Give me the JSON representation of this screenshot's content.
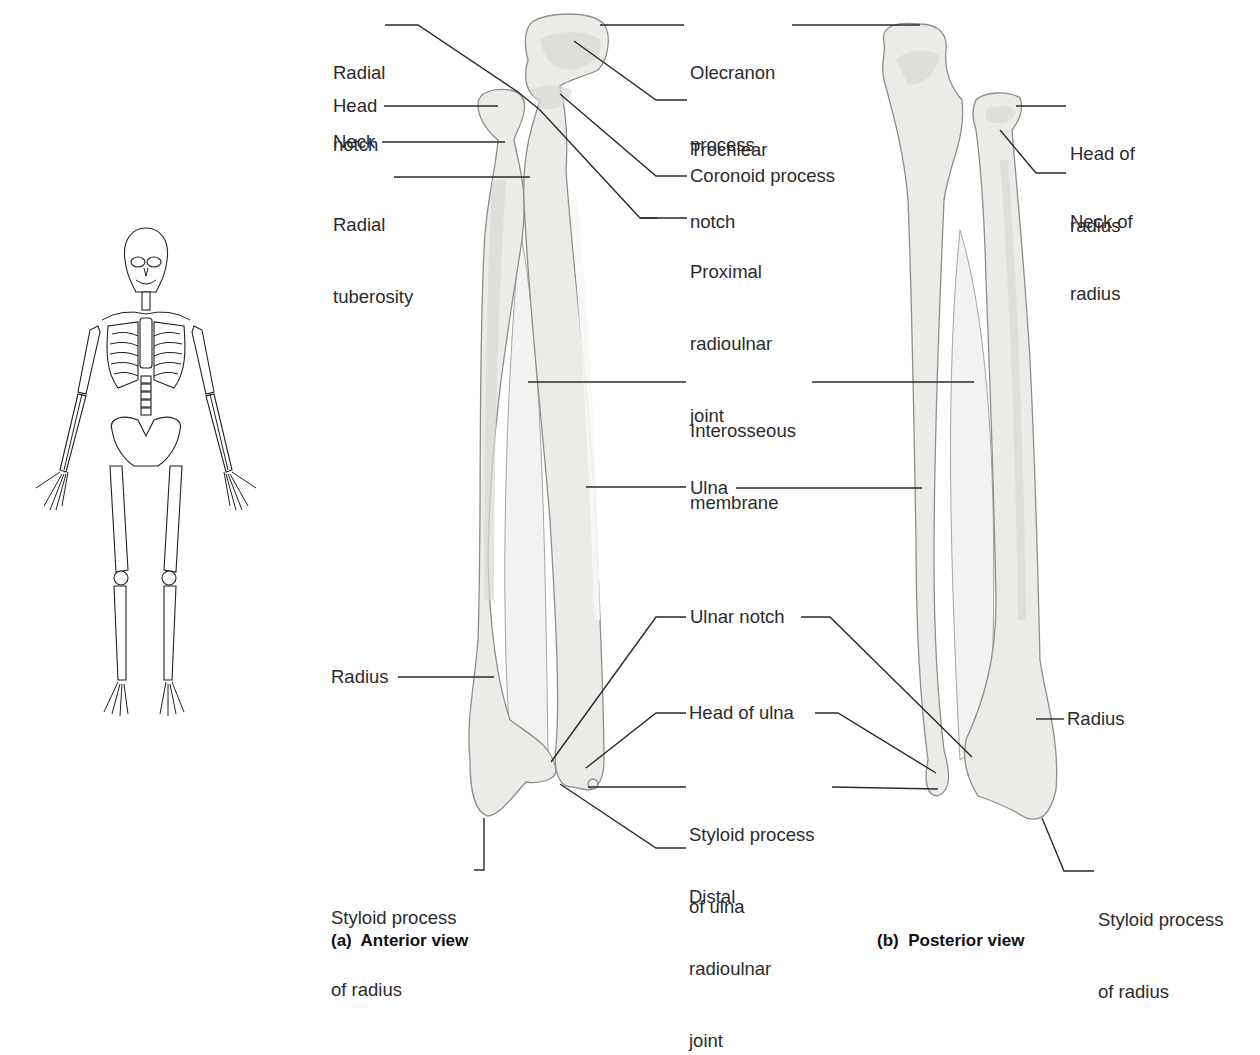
{
  "figure": {
    "panels": [
      {
        "id": "a",
        "caption": "(a)  Anterior view"
      },
      {
        "id": "b",
        "caption": "(b)  Posterior view"
      }
    ]
  },
  "anterior_labels": {
    "radial_notch": [
      "Radial",
      "notch"
    ],
    "head": [
      "Head"
    ],
    "neck": [
      "Neck"
    ],
    "radial_tuberosity": [
      "Radial",
      "tuberosity"
    ],
    "radius": [
      "Radius"
    ],
    "styloid_process_of_radius": [
      "Styloid process",
      "of radius"
    ]
  },
  "center_labels": {
    "olecranon_process": [
      "Olecranon",
      "process"
    ],
    "trochlear_notch": [
      "Trochlear",
      "notch"
    ],
    "coronoid_process": [
      "Coronoid process"
    ],
    "proximal_radioulnar_joint": [
      "Proximal",
      "radioulnar",
      "joint"
    ],
    "interosseous_membrane": [
      "Interosseous",
      "membrane"
    ],
    "ulna": [
      "Ulna"
    ],
    "ulnar_notch": [
      "Ulnar notch"
    ],
    "head_of_ulna": [
      "Head of ulna"
    ],
    "styloid_process_of_ulna": [
      "Styloid process",
      "of ulna"
    ],
    "distal_radioulnar_joint": [
      "Distal",
      "radioulnar",
      "joint"
    ]
  },
  "posterior_labels": {
    "head_of_radius": [
      "Head of",
      "radius"
    ],
    "neck_of_radius": [
      "Neck of",
      "radius"
    ],
    "radius": [
      "Radius"
    ],
    "styloid_process_of_radius": [
      "Styloid process",
      "of radius"
    ]
  },
  "orientation_figure": {
    "subject": "full-skeleton-anterior",
    "highlight": "forearm"
  },
  "colors": {
    "bone_fill": "#ecebe8",
    "bone_outline": "#8e8e8e",
    "leader": "#2a2a2a",
    "text": "#2b2b2b"
  }
}
